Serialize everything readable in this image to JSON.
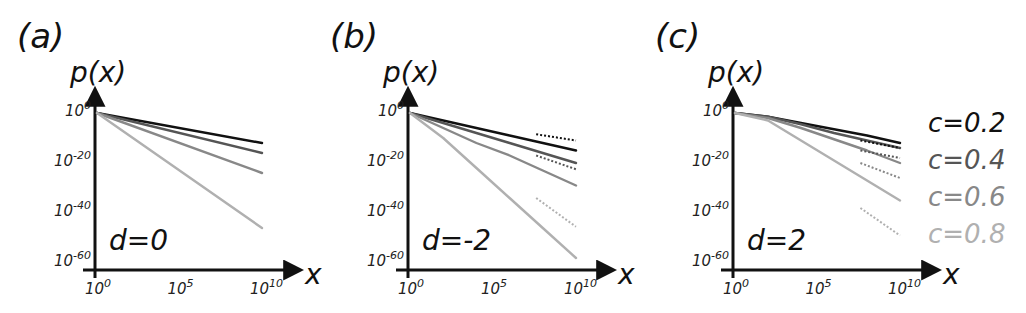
{
  "figure": {
    "panels": [
      {
        "label": "(a)",
        "d_label": "d=0"
      },
      {
        "label": "(b)",
        "d_label": "d=-2"
      },
      {
        "label": "(c)",
        "d_label": "d=2"
      }
    ],
    "y_axis_title": "p(x)",
    "x_axis_title": "x",
    "y_ticks": [
      "10^0",
      "10^-20",
      "10^-40",
      "10^-60"
    ],
    "x_ticks": [
      "10^0",
      "10^5",
      "10^10"
    ],
    "legend": [
      {
        "label": "c=0.2",
        "color": "#111111"
      },
      {
        "label": "c=0.4",
        "color": "#555555"
      },
      {
        "label": "c=0.6",
        "color": "#888888"
      },
      {
        "label": "c=0.8",
        "color": "#b0b0b0"
      }
    ]
  },
  "chart_data": [
    {
      "type": "line",
      "title": "(a) d=0",
      "xlabel": "x",
      "ylabel": "p(x)",
      "xscale": "log",
      "yscale": "log",
      "xlim": [
        1,
        10000000000.0
      ],
      "ylim": [
        1e-60,
        1
      ],
      "x_ticks": [
        "10^0",
        "10^5",
        "10^10"
      ],
      "y_ticks": [
        "10^0",
        "10^-20",
        "10^-40",
        "10^-60"
      ],
      "x_log10": [
        0,
        10
      ],
      "series": [
        {
          "name": "c=0.2",
          "style": "solid",
          "y_log10": [
            0,
            -12
          ]
        },
        {
          "name": "c=0.4",
          "style": "solid",
          "y_log10": [
            0,
            -16
          ]
        },
        {
          "name": "c=0.6",
          "style": "solid",
          "y_log10": [
            0,
            -24
          ]
        },
        {
          "name": "c=0.8",
          "style": "solid",
          "y_log10": [
            0,
            -46
          ]
        }
      ],
      "grid": false
    },
    {
      "type": "line",
      "title": "(b) d=-2",
      "xlabel": "x",
      "ylabel": "p(x)",
      "xscale": "log",
      "yscale": "log",
      "xlim": [
        1,
        10000000000.0
      ],
      "ylim": [
        1e-60,
        1
      ],
      "x_ticks": [
        "10^0",
        "10^5",
        "10^10"
      ],
      "y_ticks": [
        "10^0",
        "10^-20",
        "10^-40",
        "10^-60"
      ],
      "x_log10": [
        0,
        2,
        4,
        6,
        8,
        10
      ],
      "series": [
        {
          "name": "c=0.2",
          "style": "solid",
          "y_log10": [
            0,
            -3,
            -6,
            -9,
            -12,
            -15
          ]
        },
        {
          "name": "c=0.4",
          "style": "solid",
          "y_log10": [
            0,
            -4,
            -8,
            -12,
            -16,
            -20
          ]
        },
        {
          "name": "c=0.6",
          "style": "solid",
          "y_log10": [
            0,
            -6,
            -12,
            -17,
            -23,
            -29
          ]
        },
        {
          "name": "c=0.8",
          "style": "solid",
          "y_log10": [
            0,
            -10,
            -22,
            -34,
            -46,
            -58
          ]
        }
      ],
      "asymptotes": [
        {
          "name": "c=0.2",
          "style": "dotted",
          "x_log10": [
            7.6,
            10
          ],
          "y_log10": [
            -8.5,
            -11
          ]
        },
        {
          "name": "c=0.4",
          "style": "dotted",
          "x_log10": [
            7.6,
            10
          ],
          "y_log10": [
            -17,
            -22.5
          ]
        },
        {
          "name": "c=0.8",
          "style": "dotted",
          "x_log10": [
            7.6,
            10
          ],
          "y_log10": [
            -34,
            -45.5
          ]
        }
      ],
      "grid": false
    },
    {
      "type": "line",
      "title": "(c) d=2",
      "xlabel": "x",
      "ylabel": "p(x)",
      "xscale": "log",
      "yscale": "log",
      "xlim": [
        1,
        10000000000.0
      ],
      "ylim": [
        1e-60,
        1
      ],
      "x_ticks": [
        "10^0",
        "10^5",
        "10^10"
      ],
      "y_ticks": [
        "10^0",
        "10^-20",
        "10^-40",
        "10^-60"
      ],
      "x_log10": [
        0,
        2,
        4,
        6,
        8,
        10
      ],
      "series": [
        {
          "name": "c=0.2",
          "style": "solid",
          "y_log10": [
            0,
            -1.5,
            -4,
            -6.5,
            -9,
            -12
          ]
        },
        {
          "name": "c=0.4",
          "style": "solid",
          "y_log10": [
            0,
            -1.5,
            -4.5,
            -8,
            -11,
            -14
          ]
        },
        {
          "name": "c=0.6",
          "style": "solid",
          "y_log10": [
            0,
            -2,
            -6,
            -10.5,
            -15,
            -20
          ]
        },
        {
          "name": "c=0.8",
          "style": "solid",
          "y_log10": [
            0,
            -3,
            -11,
            -19,
            -27,
            -35
          ]
        }
      ],
      "asymptotes": [
        {
          "name": "c=0.2",
          "style": "dotted",
          "x_log10": [
            7.6,
            10
          ],
          "y_log10": [
            -11,
            -14
          ]
        },
        {
          "name": "c=0.4",
          "style": "dotted",
          "x_log10": [
            7.6,
            10
          ],
          "y_log10": [
            -15,
            -18
          ]
        },
        {
          "name": "c=0.6",
          "style": "dotted",
          "x_log10": [
            7.6,
            10
          ],
          "y_log10": [
            -20,
            -26
          ]
        },
        {
          "name": "c=0.8",
          "style": "dotted",
          "x_log10": [
            7.6,
            10
          ],
          "y_log10": [
            -38,
            -49
          ]
        }
      ],
      "grid": false
    }
  ]
}
